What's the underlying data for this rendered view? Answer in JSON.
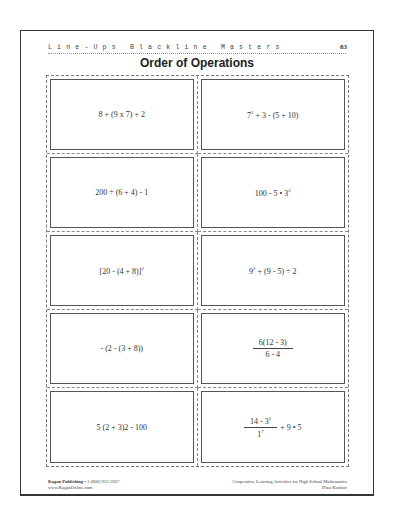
{
  "header": {
    "series": "Line-Ups Blackline Masters",
    "page_number": "83",
    "title": "Order of Operations"
  },
  "cards": [
    {
      "expr": "8 + (9 x 7) + 2"
    },
    {
      "base": "7",
      "exp": "2",
      "rest": " + 3 - (5 + 10)"
    },
    {
      "expr": "200 ÷ (6 + 4) - 1"
    },
    {
      "pre": "100 - 5 • 3",
      "exp": "2"
    },
    {
      "pre": "[20 - (4 + 8)]",
      "exp": "2"
    },
    {
      "base": "9",
      "exp": "2",
      "rest": " + (9 - 5) ÷ 2"
    },
    {
      "expr": "- (2 - (3 + 8))"
    },
    {
      "numerator": "6(12 - 3)",
      "denominator": "6 - 4"
    },
    {
      "expr": "5 (2 + 3)2 - 100"
    },
    {
      "num_pre": "14 - 3",
      "num_exp": "2",
      "den_base": "1",
      "den_exp": "7",
      "tail": "+ 9 • 5"
    }
  ],
  "footer": {
    "publisher": "Kagan Publishing",
    "phone": " • 1 (800) 933-2667",
    "website": "www.KaganOnline.com",
    "book_title": "Cooperative Learning Activities for High School Mathematics",
    "author": "Dina Kushnir"
  }
}
